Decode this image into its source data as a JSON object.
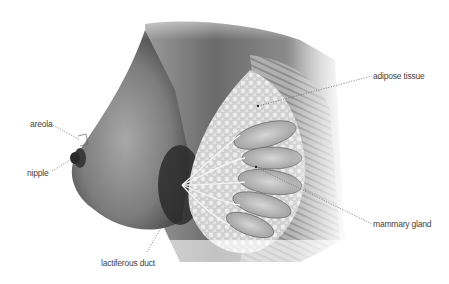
{
  "diagram": {
    "labels": [
      {
        "id": "areola",
        "text": "areola"
      },
      {
        "id": "nipple",
        "text": "nipple"
      },
      {
        "id": "adipose",
        "text": "adipose tissue"
      },
      {
        "id": "mammary",
        "text": "mammary gland"
      },
      {
        "id": "lactiferous",
        "text": "lactiferous duct"
      }
    ],
    "colors": {
      "background": "#ffffff",
      "label_text": "#444444",
      "leader_line": "#666666",
      "skin_dark": "#3a3a3a",
      "skin_mid": "#8a8a8a",
      "skin_light": "#cfcfcf",
      "tissue_light": "#e6e6e6"
    }
  }
}
